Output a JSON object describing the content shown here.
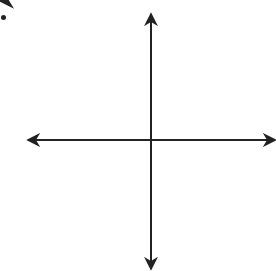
{
  "chart_data": {
    "type": "line",
    "title": "",
    "xlabel": "x",
    "ylabel": "f(x)",
    "xlim": [
      -6,
      6
    ],
    "ylim": [
      -6,
      6
    ],
    "grid": true,
    "grid_step": 1,
    "x_tick_labels": [
      -4,
      -2,
      4
    ],
    "y_tick_labels": [
      4,
      2,
      -2,
      -4
    ],
    "origin_label": "0",
    "series": [
      {
        "name": "f(x)",
        "equation": "f(x) = x/4 - 3",
        "slope": 0.25,
        "y_intercept": -3,
        "x": [
          -6,
          0,
          6
        ],
        "y": [
          -4.5,
          -3,
          -1.5
        ],
        "arrows_both_ends": true
      }
    ]
  },
  "labels": {
    "x_axis": "x",
    "y_axis": "f(x)",
    "origin": "0",
    "xt_m4": "-4",
    "xt_m2": "-2",
    "xt_4": "4",
    "yt_4": "4",
    "yt_2": "2",
    "yt_m2": "-2",
    "yt_m4": "-4"
  },
  "colors": {
    "axis": "#222222",
    "grid": "#c8c8c8",
    "line": "#222222"
  }
}
